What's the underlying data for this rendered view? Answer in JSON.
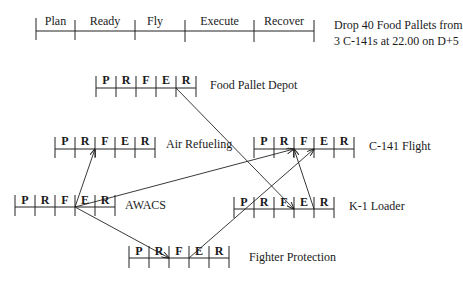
{
  "legend_timeline": {
    "phases": [
      "Plan",
      "Ready",
      "Fly",
      "Execute",
      "Recover"
    ],
    "ticks_x": [
      36,
      75,
      135,
      185,
      254,
      314
    ],
    "line_y": 31
  },
  "mission": {
    "line1": "Drop 40 Food Pallets from",
    "line2": "3 C-141s at 22.00 on D+5"
  },
  "cell_labels": [
    "P",
    "R",
    "F",
    "E",
    "R"
  ],
  "units": [
    {
      "id": "food-pallet-depot",
      "name": "Food Pallet Depot",
      "x0": 96,
      "y": 88
    },
    {
      "id": "air-refueling",
      "name": "Air Refueling",
      "x0": 55,
      "y": 149
    },
    {
      "id": "c141-flight",
      "name": "C-141 Flight",
      "x0": 254,
      "y": 149
    },
    {
      "id": "awacs",
      "name": "AWACS",
      "x0": 15,
      "y": 207
    },
    {
      "id": "k1-loader",
      "name": "K-1 Loader",
      "x0": 234,
      "y": 209
    },
    {
      "id": "fighter-protection",
      "name": "Fighter Protection",
      "x0": 129,
      "y": 258
    }
  ],
  "dependencies": [
    {
      "from": "food-pallet-depot",
      "from_phase_end": "Execute",
      "to": "k1-loader",
      "to_phase_start": "Execute"
    },
    {
      "from": "awacs",
      "from_phase_end": "Fly",
      "to": "air-refueling",
      "to_phase_start": "Fly"
    },
    {
      "from": "awacs",
      "from_phase_end": "Fly",
      "to": "c141-flight",
      "to_phase_start": "Execute"
    },
    {
      "from": "awacs",
      "from_phase_end": "Fly",
      "to": "fighter-protection",
      "to_phase_start": "Fly"
    },
    {
      "from": "fighter-protection",
      "from_phase_end": "Fly",
      "to": "c141-flight",
      "to_phase_start": "Execute"
    },
    {
      "from": "k1-loader",
      "from_phase_end": "Execute",
      "to": "c141-flight",
      "to_phase_start": "Execute"
    }
  ]
}
